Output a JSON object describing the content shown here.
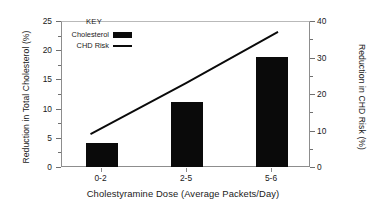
{
  "chart_data": {
    "type": "bar",
    "title": "",
    "xlabel": "Cholestyramine Dose (Average Packets/Day)",
    "ylabel": "Reduction in Total Cholesterol (%)",
    "y2label": "Reduction in CHD Risk (%)",
    "categories": [
      "0-2",
      "2-5",
      "5-6"
    ],
    "ylim": [
      0,
      25
    ],
    "y2lim": [
      0,
      40
    ],
    "yticks": [
      0,
      5,
      10,
      15,
      20,
      25
    ],
    "y2ticks": [
      0,
      10,
      20,
      30,
      40
    ],
    "ytick_labels": [
      "0",
      "5",
      "10",
      "15",
      "20",
      "25"
    ],
    "y2tick_labels": [
      "0",
      "10",
      "20",
      "30",
      "40"
    ],
    "grid": false,
    "legend_position": "top-left-inside",
    "legend_title": "KEY",
    "series": [
      {
        "name": "Cholesterol",
        "type": "bar",
        "axis": "left",
        "color": "#0a0a0a",
        "values": [
          4.3,
          11.3,
          19.0
        ]
      },
      {
        "name": "CHD Risk",
        "type": "line",
        "axis": "right",
        "color": "#0a0a0a",
        "values": [
          9.0,
          23.0,
          37.0
        ]
      }
    ]
  },
  "axes": {
    "left": {
      "title": "Reduction in Total Cholesterol (%)",
      "ticks": [
        "25",
        "20",
        "15",
        "10",
        "5",
        "0"
      ]
    },
    "right": {
      "title": "Reduction in CHD Risk (%)",
      "ticks": [
        "40",
        "30",
        "20",
        "10",
        "0"
      ]
    },
    "x": {
      "title": "Cholestyramine Dose (Average Packets/Day)",
      "ticks": [
        "0-2",
        "2-5",
        "5-6"
      ]
    }
  },
  "legend": {
    "title": "KEY",
    "entries": [
      {
        "label": "Cholesterol",
        "marker": "filled-bar-swatch"
      },
      {
        "label": "CHD Risk",
        "marker": "solid-line-swatch"
      }
    ]
  }
}
